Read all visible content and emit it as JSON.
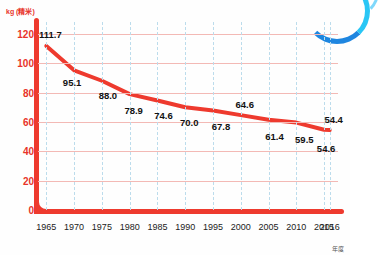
{
  "chart_data": {
    "type": "line",
    "title": "",
    "subtitle": "",
    "ylabel": "kg (精米)",
    "xlabel": "年度",
    "categories": [
      "1965",
      "1970",
      "1975",
      "1980",
      "1985",
      "1990",
      "1995",
      "2000",
      "2005",
      "2010",
      "2015",
      "2016"
    ],
    "values": [
      111.7,
      95.1,
      88.0,
      78.9,
      74.6,
      70.0,
      67.8,
      64.6,
      61.4,
      59.5,
      54.6,
      54.4
    ],
    "point_labels": [
      "111.7",
      "95.1",
      "88.0",
      "78.9",
      "74.6",
      "70.0",
      "67.8",
      "64.6",
      "61.4",
      "59.5",
      "54.6",
      "54.4"
    ],
    "yticks": [
      0,
      20,
      40,
      60,
      80,
      100,
      120
    ],
    "ytick_labels": [
      "0",
      "20",
      "40",
      "60",
      "80",
      "100",
      "120"
    ],
    "ylim": [
      0,
      128
    ],
    "xlim": [
      1963.5,
      2017.5
    ],
    "grid": {
      "horizontal": true,
      "vertical": true
    },
    "legend": {
      "show": false,
      "position": "none"
    },
    "colors": {
      "series_line": "#ee3a2e",
      "axis": "#ee3a2e",
      "ytick_text": "#e8342a",
      "xtick_text": "#222222",
      "grid_horizontal": "#f3b9b5",
      "grid_vertical": "#bcdcec",
      "point_label": "#111111",
      "accent_arc": "#2ea8f0",
      "background": "#fefefe"
    }
  },
  "decoration": {
    "corner_arc_name": "blue-arc-decoration"
  }
}
